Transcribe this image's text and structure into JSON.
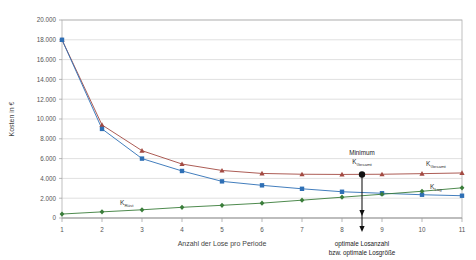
{
  "chart_data": {
    "type": "line",
    "title": "",
    "xlabel": "Anzahl der Lose pro Periode",
    "ylabel": "Kosten in €",
    "x": [
      1,
      2,
      3,
      4,
      5,
      6,
      7,
      8,
      9,
      10,
      11
    ],
    "xlim": [
      1,
      11
    ],
    "ylim": [
      0,
      20000
    ],
    "ytick_labels": [
      "20.000",
      "18.000",
      "16.000",
      "14.000",
      "12.000",
      "10.000",
      "8.000",
      "6.000",
      "4.000",
      "2.000",
      "0"
    ],
    "ytick_values": [
      20000,
      18000,
      16000,
      14000,
      12000,
      10000,
      8000,
      6000,
      4000,
      2000,
      0
    ],
    "xtick_labels": [
      "1",
      "2",
      "3",
      "4",
      "5",
      "6",
      "7",
      "8",
      "9",
      "10",
      "11"
    ],
    "grid": true,
    "legend_position": "inline-labels",
    "series": [
      {
        "name": "K_Gesamt",
        "label_main": "K",
        "label_sub": "Gesamt",
        "color": "#a34a42",
        "marker": "triangle",
        "values": [
          18000,
          9400,
          6800,
          5450,
          4800,
          4500,
          4420,
          4400,
          4420,
          4480,
          4550
        ]
      },
      {
        "name": "K_Lag",
        "label_main": "K",
        "label_sub": "Lag",
        "color": "#2e6fb5",
        "marker": "square",
        "values": [
          18000,
          9000,
          6000,
          4750,
          3700,
          3300,
          2950,
          2650,
          2500,
          2350,
          2250
        ]
      },
      {
        "name": "K_Ruest",
        "label_main": "K",
        "label_sub": "Rüst",
        "color": "#3a7d3a",
        "marker": "diamond",
        "values": [
          400,
          620,
          830,
          1080,
          1280,
          1500,
          1800,
          2100,
          2400,
          2700,
          3050
        ]
      }
    ],
    "annotations": {
      "minimum_title": "Minimum",
      "minimum_sub_main": "K",
      "minimum_sub_sub": "Gesamt",
      "minimum_x": 8.5,
      "minimum_y": 4400,
      "xaxis_note_line1": "optimale Losanzahl",
      "xaxis_note_line2": "bzw. optimale Losgröße"
    }
  }
}
